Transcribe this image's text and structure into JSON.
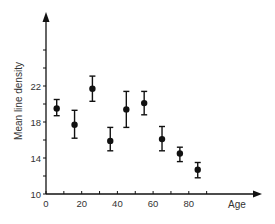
{
  "chart_data": {
    "type": "scatter",
    "title": "",
    "xlabel": "Age",
    "ylabel": "Mean line density",
    "xlim": [
      0,
      120
    ],
    "ylim": [
      10,
      30
    ],
    "grid": false,
    "legend": null,
    "x_ticks": [
      0,
      10,
      20,
      30,
      40,
      50,
      60,
      70,
      80,
      90
    ],
    "x_tick_labels": [
      "0",
      "",
      "20",
      "",
      "40",
      "",
      "60",
      "",
      "80",
      ""
    ],
    "y_ticks": [
      10,
      12,
      14,
      16,
      18,
      20,
      22,
      24,
      26
    ],
    "y_tick_labels": [
      "10",
      "",
      "14",
      "",
      "18",
      "",
      "22",
      "",
      ""
    ],
    "series": [
      {
        "name": "Mean line density",
        "marker": "filled-circle",
        "error_bars": true,
        "x": [
          6,
          16,
          26,
          36,
          45,
          55,
          65,
          75,
          85
        ],
        "y": [
          19.5,
          17.7,
          21.7,
          15.9,
          19.4,
          20.1,
          16.1,
          14.5,
          12.7
        ],
        "y_err_low": [
          18.7,
          16.2,
          20.3,
          14.8,
          17.4,
          18.8,
          14.8,
          13.6,
          11.8
        ],
        "y_err_high": [
          20.5,
          19.3,
          23.1,
          17.4,
          21.4,
          21.4,
          17.5,
          15.2,
          13.5
        ]
      }
    ]
  },
  "colors": {
    "ink": "#111111",
    "text": "#333333",
    "background": "#ffffff"
  }
}
